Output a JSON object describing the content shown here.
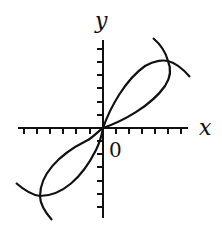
{
  "diagram": {
    "type": "function-and-inverse-graph",
    "axes": {
      "x_label": "x",
      "y_label": "y",
      "origin_label": "0",
      "x_ticks": 12,
      "y_ticks": 13
    },
    "curves": [
      {
        "name": "y = f(x)",
        "description": "passes through origin, rises to a maximum in quadrant I then descends"
      },
      {
        "name": "x = f(y)",
        "description": "reflection of the first curve across y = x"
      }
    ],
    "intersections": [
      "origin",
      "quadrant I",
      "quadrant III"
    ],
    "colors": {
      "stroke": "#111111",
      "background": "#ffffff"
    }
  }
}
